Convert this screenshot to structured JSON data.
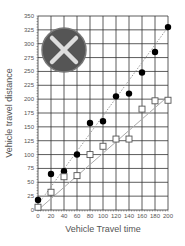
{
  "chart_data": {
    "type": "scatter",
    "title": "",
    "xlabel": "Vehicle Travel time",
    "ylabel": "Vehicle travel distance",
    "xlim": [
      0,
      200
    ],
    "ylim": [
      0,
      350
    ],
    "x_ticks": [
      0,
      20,
      40,
      60,
      80,
      100,
      120,
      140,
      160,
      180,
      200
    ],
    "x_tick_labels": [
      "0",
      "20",
      "40",
      "60",
      "80",
      "100",
      "120",
      "140",
      "160",
      "180",
      "200"
    ],
    "y_ticks": [
      0,
      25,
      50,
      75,
      100,
      125,
      150,
      175,
      200,
      225,
      250,
      275,
      300,
      325,
      350
    ],
    "y_tick_labels": [
      "0",
      "25",
      "50",
      "75",
      "100",
      "125",
      "150",
      "175",
      "200",
      "225",
      "250",
      "275",
      "300",
      "325",
      "350"
    ],
    "grid": true,
    "legend": "none",
    "series": [
      {
        "name": "filled-circles",
        "marker": "filled-circle",
        "color": "#000000",
        "x": [
          0,
          20,
          40,
          60,
          80,
          100,
          120,
          140,
          160,
          180,
          200
        ],
        "values": [
          18,
          65,
          70,
          100,
          157,
          160,
          205,
          210,
          248,
          285,
          330
        ],
        "trendline": {
          "style": "dotted",
          "color": "#999999",
          "from": [
            0,
            10
          ],
          "to": [
            200,
            330
          ]
        }
      },
      {
        "name": "open-squares",
        "marker": "open-square",
        "color": "#555555",
        "x": [
          0,
          20,
          40,
          60,
          80,
          100,
          120,
          140,
          160,
          180,
          200
        ],
        "values": [
          5,
          32,
          60,
          62,
          100,
          115,
          128,
          128,
          182,
          197,
          198
        ],
        "trendline": {
          "style": "solid",
          "color": "#aaaaaa",
          "from": [
            0,
            0
          ],
          "to": [
            200,
            205
          ]
        }
      }
    ]
  },
  "overlay": {
    "icon": "close-x-icon",
    "circle_color": "#555555",
    "x_color": "#dddddd"
  }
}
